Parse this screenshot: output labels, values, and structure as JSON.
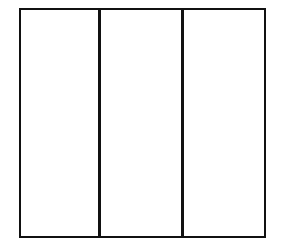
{
  "diagram": {
    "type": "rectangle-divided-into-vertical-sections",
    "section_count": 3,
    "sections": [
      {
        "index": 1,
        "label": ""
      },
      {
        "index": 2,
        "label": ""
      },
      {
        "index": 3,
        "label": ""
      }
    ],
    "colors": {
      "stroke": "#111111",
      "fill": "#ffffff"
    }
  }
}
